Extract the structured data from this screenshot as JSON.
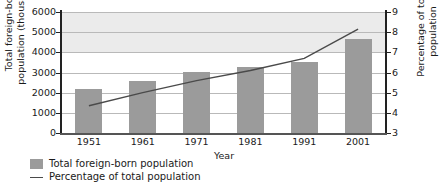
{
  "chart_data": {
    "type": "bar",
    "title": "",
    "subtitle": "",
    "xlabel": "Year",
    "ylabel": "Total foreign-born population (thousands)",
    "y2label": "Percentage of total population",
    "categories": [
      "1951",
      "1961",
      "1971",
      "1981",
      "1991",
      "2001"
    ],
    "ylim": [
      0,
      6000
    ],
    "y2lim": [
      3,
      9
    ],
    "yticks": [
      "0",
      "1000",
      "2000",
      "3000",
      "4000",
      "5000",
      "6000"
    ],
    "y2ticks": [
      "3",
      "4",
      "5",
      "6",
      "7",
      "8",
      "9"
    ],
    "grid": true,
    "legend_position": "bottom-left",
    "series": [
      {
        "name": "Total foreign-born population",
        "type": "bar",
        "axis": "left",
        "color": "#9b9b9b",
        "values": [
          2200,
          2600,
          3020,
          3270,
          3520,
          4640
        ]
      },
      {
        "name": "Percentage of total population",
        "type": "line",
        "axis": "right",
        "color": "#4a4a4a",
        "values": [
          4.35,
          5.0,
          5.6,
          6.1,
          6.7,
          8.15
        ]
      }
    ]
  },
  "axes": {
    "left_title": "Total foreign-born population (thousands)",
    "left_title_line1": "Total foreign-born",
    "left_title_line2": "population (thousands)",
    "right_title": "Percentage of total population",
    "x_title": "Year"
  },
  "legend": {
    "items": [
      {
        "label": "Total foreign-born population",
        "marker": "bar-swatch-icon",
        "color": "#9b9b9b"
      },
      {
        "label": "Percentage of total population",
        "marker": "line-swatch-icon",
        "color": "#4a4a4a"
      }
    ]
  },
  "colors": {
    "bar": "#9b9b9b",
    "line": "#4a4a4a",
    "grid": "#b9b9b9",
    "axis": "#222222",
    "band": "#ebebeb",
    "background": "#ffffff"
  }
}
